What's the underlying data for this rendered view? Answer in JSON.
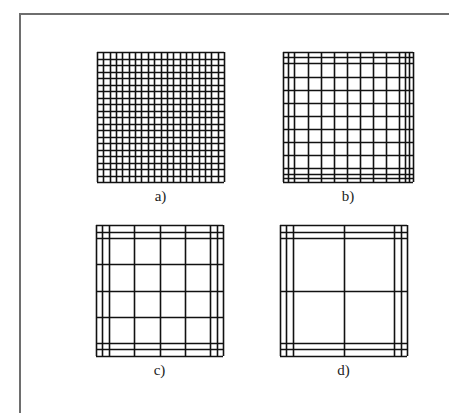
{
  "figure": {
    "panels": [
      {
        "id": "a",
        "caption": "a)",
        "box": {
          "x": 97,
          "y": 52,
          "w": 127,
          "h": 130
        },
        "lines": [
          0,
          0.05,
          0.1,
          0.15,
          0.2,
          0.25,
          0.3,
          0.35,
          0.4,
          0.45,
          0.5,
          0.55,
          0.6,
          0.65,
          0.7,
          0.75,
          0.8,
          0.85,
          0.9,
          0.95,
          1
        ]
      },
      {
        "id": "b",
        "caption": "b)",
        "box": {
          "x": 283,
          "y": 52,
          "w": 130,
          "h": 130
        },
        "lines": [
          0,
          0.04,
          0.085,
          0.19,
          0.29,
          0.39,
          0.49,
          0.59,
          0.69,
          0.79,
          0.89,
          0.935,
          0.97,
          1
        ]
      },
      {
        "id": "c",
        "caption": "c)",
        "box": {
          "x": 96,
          "y": 225,
          "w": 127,
          "h": 131
        },
        "lines": [
          0,
          0.05,
          0.1,
          0.3,
          0.5,
          0.7,
          0.9,
          0.95,
          1
        ]
      },
      {
        "id": "d",
        "caption": "d)",
        "box": {
          "x": 280,
          "y": 225,
          "w": 127,
          "h": 131
        },
        "lines": [
          0,
          0.05,
          0.1,
          0.5,
          0.9,
          0.95,
          1
        ]
      }
    ],
    "colors": {
      "grid_line": "#111111",
      "frame": "#6e6e6e",
      "caption": "#222222"
    }
  }
}
